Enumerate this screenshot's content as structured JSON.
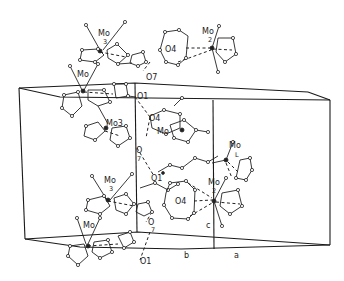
{
  "figure": {
    "type": "crystal packing diagram",
    "axes_labels": {
      "b": "b",
      "c": "c",
      "a": "a"
    },
    "labels": [
      {
        "id": "mo-top-left",
        "text": "Mo",
        "sub": "3",
        "x": 100,
        "y": 36
      },
      {
        "id": "mo-top-right",
        "text": "Mo",
        "sub": "2",
        "x": 204,
        "y": 34
      },
      {
        "id": "o4-top",
        "text": "O4",
        "x": 168,
        "y": 48
      },
      {
        "id": "mo-upper-left",
        "text": "Mo",
        "x": 78,
        "y": 77
      },
      {
        "id": "o7-top",
        "text": "O7",
        "x": 146,
        "y": 80
      },
      {
        "id": "o1-top",
        "text": "O1",
        "x": 138,
        "y": 97
      },
      {
        "id": "mo3-mid",
        "text": "Mo3",
        "x": 108,
        "y": 125
      },
      {
        "id": "o4-mid",
        "text": "O4",
        "x": 150,
        "y": 120
      },
      {
        "id": "mo-mid",
        "text": "Mo",
        "x": 158,
        "y": 133
      },
      {
        "id": "o7-mid",
        "text": "O",
        "sub": "7",
        "x": 136,
        "y": 154
      },
      {
        "id": "o1-mid",
        "text": "O1",
        "x": 151,
        "y": 180
      },
      {
        "id": "mo-right-l",
        "text": "Mo",
        "sub": "L",
        "x": 231,
        "y": 152
      },
      {
        "id": "o4-low",
        "text": "O4",
        "x": 175,
        "y": 203
      },
      {
        "id": "mo-right-2",
        "text": "Mo",
        "sub": "2",
        "x": 209,
        "y": 183
      },
      {
        "id": "mo-low-left",
        "text": "Mo",
        "sub": "3",
        "x": 104,
        "y": 182
      },
      {
        "id": "mo-bottom-left",
        "text": "Mo",
        "x": 83,
        "y": 227
      },
      {
        "id": "o7-low",
        "text": "O",
        "sub": "7",
        "x": 149,
        "y": 224
      },
      {
        "id": "o1-bottom",
        "text": "O1",
        "x": 140,
        "y": 262
      },
      {
        "id": "axis-c",
        "text": "c",
        "x": 208,
        "y": 227
      },
      {
        "id": "axis-b",
        "text": "b",
        "x": 186,
        "y": 257
      },
      {
        "id": "axis-a",
        "text": "a",
        "x": 236,
        "y": 257
      }
    ]
  }
}
